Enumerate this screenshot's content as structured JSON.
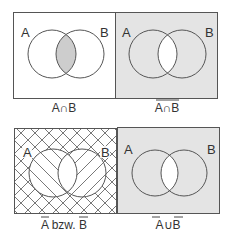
{
  "colors": {
    "stroke": "#555555",
    "shade": "#e4e4e4",
    "lens_shade": "#cdcdcd",
    "background": "#ffffff",
    "hatch": "#555555"
  },
  "panels": [
    {
      "id": "intersection",
      "label_a": "A",
      "label_b": "B",
      "caption_parts": [
        "A",
        "∩",
        "B"
      ],
      "caption_overline": false,
      "shaded_region": "A∩B"
    },
    {
      "id": "complement-of-intersection",
      "label_a": "A",
      "label_b": "B",
      "caption_parts": [
        "A",
        "∩",
        "B"
      ],
      "caption_overline": true,
      "shaded_region": "complement of A∩B"
    },
    {
      "id": "complements",
      "label_a": "A",
      "label_b": "B",
      "caption_parts": [
        "A",
        " bzw. ",
        "B"
      ],
      "caption_overline": "A and B individually",
      "shaded_region": "hatched: complement of A (one direction) and complement of B (other direction)"
    },
    {
      "id": "union-of-complements",
      "label_a": "A",
      "label_b": "B",
      "caption_parts": [
        "A",
        "∪",
        "B"
      ],
      "caption_overline": "A and B individually",
      "shaded_region": "complement of A∩B"
    }
  ]
}
